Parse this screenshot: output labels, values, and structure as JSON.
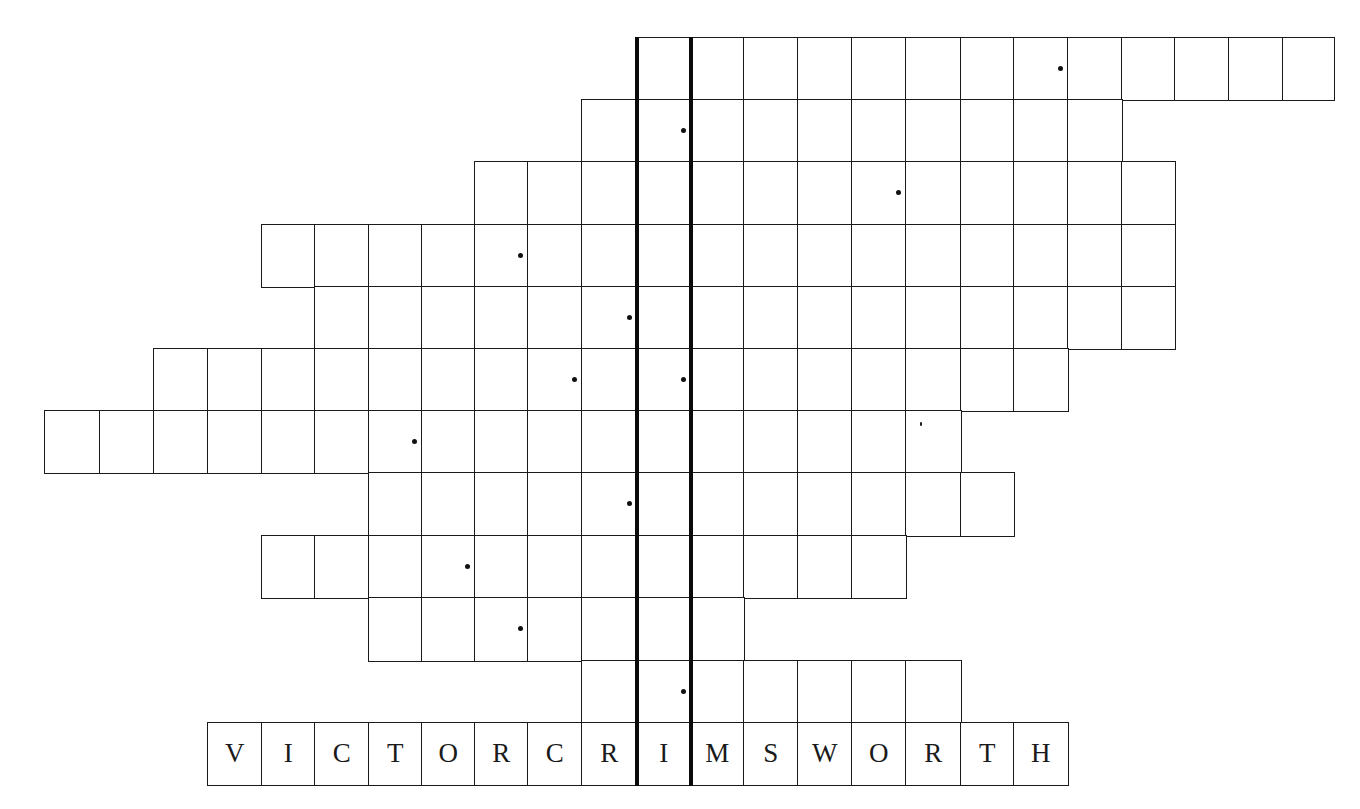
{
  "puzzle": {
    "type": "acrostic-crossword-grid",
    "highlight_column": 11,
    "highlight_color": "#0a0a0a",
    "grid_line_color": "#1a1a1a",
    "col_edges": [
      44,
      99,
      153,
      207,
      261,
      314,
      368,
      421,
      474,
      527,
      581,
      636,
      690,
      743,
      797,
      851,
      905,
      960,
      1013,
      1067,
      1121,
      1174,
      1228,
      1282,
      1333
    ],
    "row_edges": [
      37,
      99,
      161,
      224,
      286,
      348,
      410,
      472,
      535,
      597,
      660,
      722,
      784
    ],
    "rows": [
      {
        "index": 0,
        "start_col": 11,
        "end_col": 23,
        "dot_cols": [
          18
        ],
        "letters": ""
      },
      {
        "index": 1,
        "start_col": 10,
        "end_col": 19,
        "dot_cols": [
          11
        ],
        "letters": ""
      },
      {
        "index": 2,
        "start_col": 8,
        "end_col": 20,
        "dot_cols": [
          15
        ],
        "letters": ""
      },
      {
        "index": 3,
        "start_col": 4,
        "end_col": 20,
        "dot_cols": [
          8
        ],
        "letters": ""
      },
      {
        "index": 4,
        "start_col": 5,
        "end_col": 20,
        "dot_cols": [
          10
        ],
        "letters": ""
      },
      {
        "index": 5,
        "start_col": 2,
        "end_col": 18,
        "dot_cols": [
          9,
          11
        ],
        "letters": ""
      },
      {
        "index": 6,
        "start_col": 0,
        "end_col": 16,
        "dot_cols": [
          6
        ],
        "letters": ""
      },
      {
        "index": 7,
        "start_col": 6,
        "end_col": 17,
        "dot_cols": [
          10
        ],
        "letters": ""
      },
      {
        "index": 8,
        "start_col": 4,
        "end_col": 15,
        "dot_cols": [
          7
        ],
        "letters": ""
      },
      {
        "index": 9,
        "start_col": 6,
        "end_col": 12,
        "dot_cols": [
          8
        ],
        "letters": ""
      },
      {
        "index": 10,
        "start_col": 10,
        "end_col": 16,
        "dot_cols": [
          11
        ],
        "letters": ""
      },
      {
        "index": 11,
        "start_col": 3,
        "end_col": 18,
        "dot_cols": [],
        "letters": "VICTORCRIMSWORTH"
      }
    ],
    "answer_row": {
      "label": "VICTOR CRIMSWORTH",
      "letters": [
        "V",
        "I",
        "C",
        "T",
        "O",
        "R",
        "C",
        "R",
        "I",
        "M",
        "S",
        "W",
        "O",
        "R",
        "T",
        "H"
      ]
    }
  }
}
